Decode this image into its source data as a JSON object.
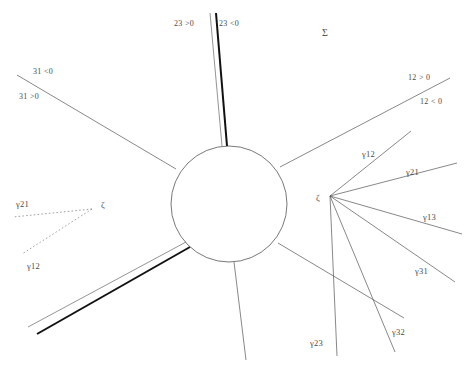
{
  "figure": {
    "name": "scattering-diagram",
    "background_color": "#ffffff",
    "line_color": "#555555",
    "thick_line_color": "#111111",
    "dashed_line_color": "#777777",
    "width": 465,
    "height": 369
  },
  "central_region": {
    "name": "central-circle",
    "cx": 229,
    "cy": 204,
    "r": 58
  },
  "vertices": {
    "right_fan": {
      "label": "ζ",
      "x": 316,
      "y": 200,
      "vx": 330,
      "vy": 196
    },
    "left_fan": {
      "label": "ζ",
      "x": 101,
      "y": 206,
      "vx": 92,
      "vy": 209
    }
  },
  "labels": [
    {
      "id": "sigma",
      "text": "Σ",
      "x": 322,
      "y": 28,
      "kind": "sigma"
    },
    {
      "id": "wall-23-pos",
      "text": "23 >0",
      "x": 174,
      "y": 20,
      "kind": "plain"
    },
    {
      "id": "wall-23-neg",
      "text": "23 <0",
      "x": 219,
      "y": 20,
      "kind": "plain"
    },
    {
      "id": "wall-31-neg",
      "text": "31 <0",
      "x": 33,
      "y": 68,
      "kind": "plain"
    },
    {
      "id": "wall-31-pos",
      "text": "31 >0",
      "x": 19,
      "y": 93,
      "kind": "plain"
    },
    {
      "id": "wall-12-pos",
      "text": "12 > 0",
      "x": 408,
      "y": 74,
      "kind": "plain"
    },
    {
      "id": "wall-12-neg",
      "text": "12 < 0",
      "x": 420,
      "y": 98,
      "kind": "plain"
    },
    {
      "id": "g12-right",
      "text": "γ12",
      "x": 362,
      "y": 150,
      "kind": "gamma"
    },
    {
      "id": "g21-right",
      "text": "γ21",
      "x": 406,
      "y": 168,
      "kind": "gamma"
    },
    {
      "id": "g13-right",
      "text": "γ13",
      "x": 423,
      "y": 213,
      "kind": "gamma"
    },
    {
      "id": "g31-right",
      "text": "γ31",
      "x": 415,
      "y": 267,
      "kind": "gamma"
    },
    {
      "id": "g32-right",
      "text": "γ32",
      "x": 392,
      "y": 328,
      "kind": "gamma"
    },
    {
      "id": "g23-right",
      "text": "γ23",
      "x": 310,
      "y": 339,
      "kind": "gamma"
    },
    {
      "id": "g21-left",
      "text": "γ21",
      "x": 16,
      "y": 200,
      "kind": "gamma"
    },
    {
      "id": "g12-left",
      "text": "γ12",
      "x": 27,
      "y": 262,
      "kind": "gamma"
    },
    {
      "id": "zeta-right",
      "text": "ζ",
      "x": 316,
      "y": 194,
      "kind": "zeta"
    },
    {
      "id": "zeta-left",
      "text": "ζ",
      "x": 101,
      "y": 201,
      "kind": "zeta"
    }
  ],
  "lines": [
    {
      "id": "ray-31",
      "name": "wall-ray-31",
      "x1": 17,
      "y1": 75,
      "x2": 176,
      "y2": 169,
      "w": 0.7,
      "style": "solid",
      "color": "#555555"
    },
    {
      "id": "ray-23-thin",
      "name": "wall-ray-23-thin",
      "x1": 210,
      "y1": 13,
      "x2": 222,
      "y2": 146,
      "w": 0.7,
      "style": "solid",
      "color": "#666666"
    },
    {
      "id": "ray-23-thick",
      "name": "wall-ray-23-thick",
      "x1": 216,
      "y1": 13,
      "x2": 227,
      "y2": 146,
      "w": 2.0,
      "style": "solid",
      "color": "#111111"
    },
    {
      "id": "ray-12",
      "name": "wall-ray-12",
      "x1": 280,
      "y1": 167,
      "x2": 450,
      "y2": 78,
      "w": 0.7,
      "style": "solid",
      "color": "#555555"
    },
    {
      "id": "ray-sw-thin",
      "name": "wall-ray-sw-thin",
      "x1": 28,
      "y1": 327,
      "x2": 186,
      "y2": 242,
      "w": 0.7,
      "style": "solid",
      "color": "#666666"
    },
    {
      "id": "ray-sw-thick",
      "name": "wall-ray-sw-thick",
      "x1": 37,
      "y1": 334,
      "x2": 190,
      "y2": 247,
      "w": 2.0,
      "style": "solid",
      "color": "#111111"
    },
    {
      "id": "ray-south",
      "name": "wall-ray-south",
      "x1": 234,
      "y1": 262,
      "x2": 246,
      "y2": 360,
      "w": 0.7,
      "style": "solid",
      "color": "#555555"
    },
    {
      "id": "ray-se",
      "name": "wall-ray-southeast",
      "x1": 278,
      "y1": 243,
      "x2": 404,
      "y2": 318,
      "w": 0.7,
      "style": "solid",
      "color": "#555555"
    },
    {
      "id": "fan-r-g12",
      "name": "gamma-ray-12-right",
      "x1": 330,
      "y1": 196,
      "x2": 411,
      "y2": 131,
      "w": 0.7,
      "style": "solid",
      "color": "#555555"
    },
    {
      "id": "fan-r-g21",
      "name": "gamma-ray-21-right",
      "x1": 330,
      "y1": 196,
      "x2": 457,
      "y2": 163,
      "w": 0.7,
      "style": "solid",
      "color": "#555555"
    },
    {
      "id": "fan-r-g13",
      "name": "gamma-ray-13-right",
      "x1": 330,
      "y1": 196,
      "x2": 462,
      "y2": 234,
      "w": 0.7,
      "style": "solid",
      "color": "#555555"
    },
    {
      "id": "fan-r-g31",
      "name": "gamma-ray-31-right",
      "x1": 330,
      "y1": 196,
      "x2": 455,
      "y2": 282,
      "w": 0.7,
      "style": "solid",
      "color": "#555555"
    },
    {
      "id": "fan-r-g32",
      "name": "gamma-ray-32-right",
      "x1": 330,
      "y1": 196,
      "x2": 395,
      "y2": 352,
      "w": 0.7,
      "style": "solid",
      "color": "#555555"
    },
    {
      "id": "fan-r-g23",
      "name": "gamma-ray-23-right",
      "x1": 330,
      "y1": 196,
      "x2": 337,
      "y2": 356,
      "w": 0.7,
      "style": "solid",
      "color": "#555555"
    },
    {
      "id": "fan-l-g21",
      "name": "gamma-ray-21-left",
      "x1": 92,
      "y1": 209,
      "x2": 13,
      "y2": 217,
      "w": 0.7,
      "style": "dashed",
      "color": "#777777"
    },
    {
      "id": "fan-l-g12",
      "name": "gamma-ray-12-left",
      "x1": 92,
      "y1": 209,
      "x2": 22,
      "y2": 254,
      "w": 0.7,
      "style": "dashed",
      "color": "#777777"
    }
  ]
}
